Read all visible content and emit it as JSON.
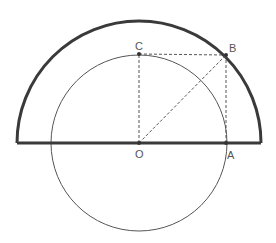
{
  "diagram": {
    "type": "geometry",
    "colors": {
      "stroke": "#3a3a3a",
      "thin_stroke": "#555555",
      "label": "#555555",
      "background": "#ffffff"
    },
    "points": {
      "O": {
        "label": "O",
        "x": 139,
        "y": 143
      },
      "A": {
        "label": "A",
        "x": 226,
        "y": 143
      },
      "B": {
        "label": "B",
        "x": 226,
        "y": 55
      },
      "C": {
        "label": "C",
        "x": 139,
        "y": 54
      }
    },
    "shapes": {
      "outer_semicircle": {
        "center": "O",
        "radius": 122,
        "style": "thick"
      },
      "inner_circle": {
        "center": "O",
        "radius": 88,
        "style": "thin"
      },
      "diameter_line": {
        "from_x": 17,
        "to_x": 261,
        "y": 143,
        "style": "thick"
      },
      "dashed_segments": [
        "OC",
        "CB",
        "BA",
        "OB"
      ]
    }
  }
}
